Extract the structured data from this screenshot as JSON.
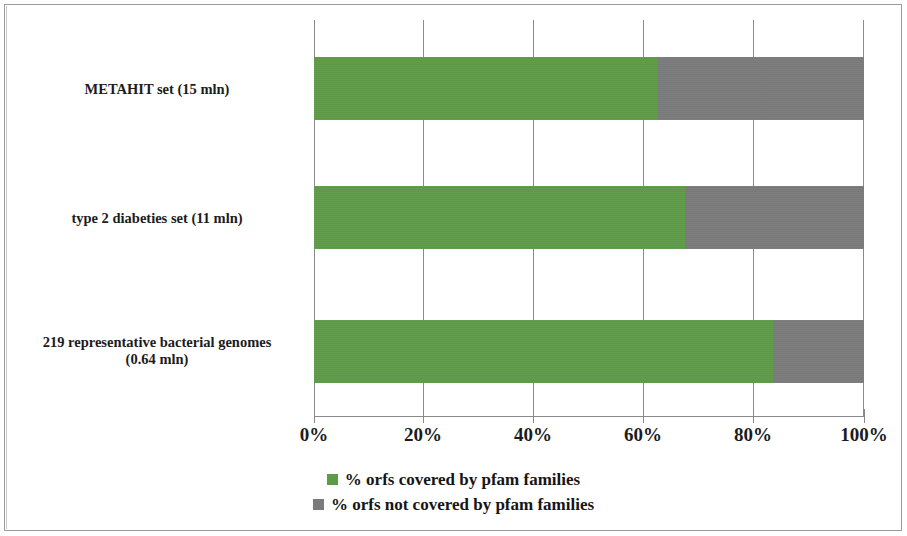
{
  "chart_data": {
    "type": "bar",
    "orientation": "horizontal",
    "stacked": true,
    "stack_total": 100,
    "title": "",
    "subtitle": "",
    "xlabel": "",
    "ylabel": "",
    "xlim": [
      0,
      100
    ],
    "xticks": [
      0,
      20,
      40,
      60,
      80,
      100
    ],
    "xtick_labels": [
      "0%",
      "20%",
      "40%",
      "60%",
      "80%",
      "100%"
    ],
    "grid": "vertical",
    "legend_position": "bottom-center",
    "categories": [
      "METAHIT set (15 mln)",
      "type 2 diabeties set (11 mln)",
      "219 representative bacterial genomes (0.64 mln)"
    ],
    "category_lines": [
      [
        "METAHIT set (15 mln)"
      ],
      [
        "type 2 diabeties set (11 mln)"
      ],
      [
        "219 representative bacterial genomes",
        "(0.64 mln)"
      ]
    ],
    "series": [
      {
        "name": "% orfs covered by pfam families",
        "color": "#5e9b48",
        "values": [
          62.5,
          67.5,
          83.5
        ]
      },
      {
        "name": "% orfs not covered by pfam families",
        "color": "#7b7b7b",
        "values": [
          37.5,
          32.5,
          16.5
        ]
      }
    ]
  },
  "legend": {
    "items": [
      {
        "label": "% orfs covered by pfam families",
        "swatch": "green-square-icon"
      },
      {
        "label": "% orfs not covered by pfam families",
        "swatch": "gray-square-icon"
      }
    ]
  },
  "colors": {
    "covered": "#5e9b48",
    "uncovered": "#7b7b7b",
    "axis": "#8a8a8a",
    "text": "#1c1c1c",
    "background": "#ffffff",
    "frame": "#9a9a9a"
  }
}
